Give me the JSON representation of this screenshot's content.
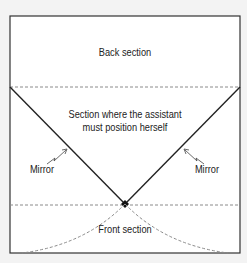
{
  "diagram": {
    "labels": {
      "back": "Back section",
      "middle_line1": "Section where the assistant",
      "middle_line2": "must position herself",
      "mirror_left": "Mirror",
      "mirror_right": "Mirror",
      "front": "Front section"
    },
    "colors": {
      "line": "#222222",
      "dashed": "#8a8a8a",
      "background": "#ffffff",
      "page": "#f3f3f3"
    }
  }
}
